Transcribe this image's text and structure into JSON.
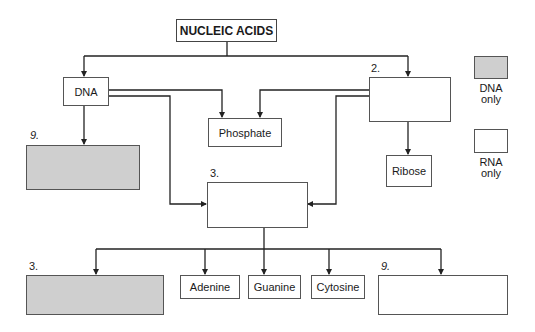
{
  "diagram": {
    "title": "NUCLEIC ACIDS",
    "nodes": {
      "dna": "DNA",
      "rna": "",
      "phosphate": "Phosphate",
      "ribose": "Ribose",
      "middle": "",
      "dna_only_sugar": "",
      "dna_only_base": "",
      "rna_only_base": "",
      "adenine": "Adenine",
      "guanine": "Guanine",
      "cytosine": "Cytosine"
    },
    "labels": {
      "rna_num": "2.",
      "dna_sugar_num": "9.",
      "middle_num": "3.",
      "dna_base_num": "3.",
      "rna_base_num": "9."
    },
    "legend": {
      "dna_line1": "DNA",
      "dna_line2": "only",
      "rna_line1": "RNA",
      "rna_line2": "only"
    },
    "colors": {
      "dna_only_fill": "#cfcfcf",
      "rna_only_fill": "#ffffff",
      "line": "#222222"
    }
  }
}
